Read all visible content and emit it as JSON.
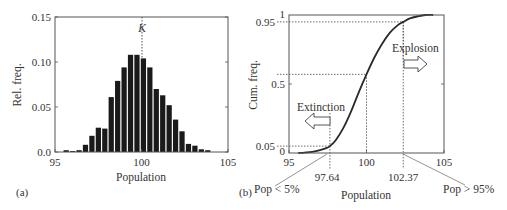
{
  "chart_data": [
    {
      "panel": "(a)",
      "type": "bar",
      "title": "",
      "xlabel": "Population",
      "ylabel": "Rel. freq.",
      "xlim": [
        95,
        105
      ],
      "ylim": [
        0,
        0.15
      ],
      "xticks": [
        "95",
        "100",
        "105"
      ],
      "yticks": [
        "0.0",
        "0.05",
        "0.10",
        "0.15"
      ],
      "grid": false,
      "bar_color": "#1a1a1a",
      "bin_start": 95.46,
      "bin_width": 0.372,
      "x": [
        95.65,
        96.02,
        96.39,
        96.76,
        97.13,
        97.51,
        97.88,
        98.25,
        98.62,
        98.99,
        99.37,
        99.74,
        100.11,
        100.48,
        100.85,
        101.23,
        101.6,
        101.97,
        102.34,
        102.71,
        103.09,
        103.46,
        103.83
      ],
      "values": [
        0.002,
        0.001,
        0.002,
        0.008,
        0.018,
        0.027,
        0.026,
        0.061,
        0.079,
        0.094,
        0.108,
        0.108,
        0.104,
        0.094,
        0.07,
        0.063,
        0.052,
        0.036,
        0.023,
        0.009,
        0.007,
        0.003,
        0.002
      ],
      "annotations": [
        {
          "text": "K",
          "x": 100,
          "style": "dotted vertical line"
        }
      ]
    },
    {
      "panel": "(b)",
      "type": "line",
      "title": "",
      "xlabel": "Population",
      "ylabel": "Cum. freq.",
      "xlim": [
        95,
        105
      ],
      "ylim": [
        0,
        1
      ],
      "xticks": [
        "95",
        "100",
        "105"
      ],
      "yticks": [
        "0",
        "0.05",
        "0.5",
        "0.95",
        "1"
      ],
      "grid": false,
      "series": [
        {
          "name": "Cumulative frequency",
          "x": [
            95.6,
            96.0,
            96.5,
            97.0,
            97.4,
            97.64,
            98.0,
            98.5,
            99.0,
            99.5,
            100.0,
            100.5,
            101.0,
            101.5,
            102.0,
            102.37,
            102.8,
            103.3,
            103.8,
            104.3
          ],
          "values": [
            0.0,
            0.003,
            0.008,
            0.02,
            0.035,
            0.05,
            0.09,
            0.18,
            0.3,
            0.44,
            0.57,
            0.69,
            0.79,
            0.87,
            0.925,
            0.95,
            0.975,
            0.99,
            1.0,
            1.0
          ]
        }
      ],
      "annotations": [
        {
          "text": "97.64",
          "x": 97.64,
          "y": 0.05,
          "style": "dotted guide lines"
        },
        {
          "text": "100",
          "x": 100,
          "y": 0.57,
          "style": "dotted guide lines"
        },
        {
          "text": "102.37",
          "x": 102.37,
          "y": 0.95,
          "style": "dotted guide lines"
        },
        {
          "text": "Extinction",
          "arrow": "left"
        },
        {
          "text": "Explosion",
          "arrow": "right"
        },
        {
          "text": "Pop < 5%",
          "pointer_to_x": 97.64
        },
        {
          "text": "Pop > 95%",
          "pointer_to_x": 102.37
        }
      ]
    }
  ],
  "panel_a": {
    "label": "(a)",
    "ylabel": "Rel. freq.",
    "xlabel": "Population",
    "k_label": "K"
  },
  "panel_b": {
    "label": "(b)",
    "ylabel": "Cum. freq.",
    "xlabel": "Population",
    "extinction_label": "Extinction",
    "explosion_label": "Explosion",
    "low_label": "Pop < 5%",
    "high_label": "Pop > 95%",
    "low_value": "97.64",
    "high_value": "102.37"
  },
  "colors": {
    "axis": "#555555",
    "bars": "#1a1a1a",
    "curve": "#2a2a2a",
    "guide": "#444444"
  }
}
